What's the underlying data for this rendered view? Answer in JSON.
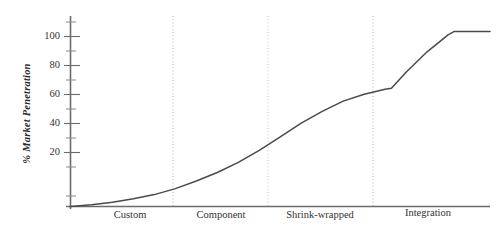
{
  "chart_data": {
    "type": "line",
    "title": "",
    "xlabel": "",
    "ylabel": "% Market Penetration",
    "ylim": [
      0,
      110
    ],
    "xlim": [
      0,
      100
    ],
    "grid": false,
    "legend": null,
    "y_major_ticks": [
      20,
      40,
      60,
      80,
      100
    ],
    "y_minor_ticks": [
      10,
      30,
      50,
      70,
      90
    ],
    "y_tick_labels": [
      "20",
      "40",
      "60",
      "80",
      "100"
    ],
    "x_categories": [
      "Custom",
      "Component",
      "Shrink-wrapped",
      "Integration"
    ],
    "x_category_boundaries": [
      0,
      24.6,
      47.0,
      72.2,
      100
    ],
    "annotations": [],
    "series": [
      {
        "name": "Market Penetration",
        "color": "#4a4a4a",
        "x": [
          0,
          5,
          10,
          15,
          20,
          25,
          30,
          35,
          40,
          45,
          50,
          55,
          60,
          65,
          70,
          75,
          76.5,
          80,
          85,
          90,
          91.5,
          95,
          100
        ],
        "y": [
          0,
          1,
          2.5,
          4.5,
          7,
          10.5,
          15,
          20,
          26,
          33,
          41,
          49,
          56,
          62,
          66,
          69,
          69.5,
          79,
          91,
          101,
          103,
          103,
          103
        ]
      }
    ]
  },
  "axis": {
    "y_axis_name": "y-axis",
    "x_axis_name": "x-axis"
  }
}
